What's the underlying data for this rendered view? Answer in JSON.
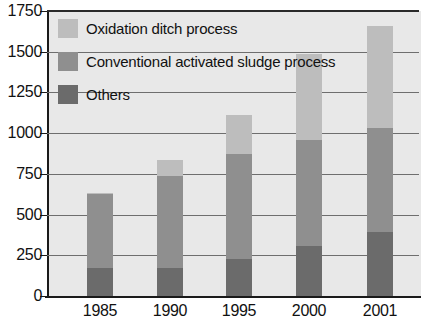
{
  "chart_data": {
    "type": "bar",
    "title": "",
    "subtitle": "",
    "xlabel": "",
    "ylabel": "",
    "stacked": true,
    "grid": true,
    "legend_position": "top-left-inside",
    "categories": [
      "1985",
      "1990",
      "1995",
      "2000",
      "2001"
    ],
    "ylim": [
      0,
      1750
    ],
    "yticks": [
      0,
      250,
      500,
      750,
      1000,
      1250,
      1500,
      1750
    ],
    "ytick_labels": [
      "0",
      "250",
      "500",
      "750",
      "1000",
      "1250",
      "1500",
      "1750"
    ],
    "series": [
      {
        "name": "Others",
        "color": "#6b6b6b",
        "values": [
          170,
          175,
          230,
          305,
          395
        ]
      },
      {
        "name": "Conventional activated sludge process",
        "color": "#8f8f8f",
        "values": [
          455,
          565,
          640,
          655,
          635
        ]
      },
      {
        "name": "Oxidation ditch process",
        "color": "#bdbdbd",
        "values": [
          10,
          95,
          240,
          525,
          630
        ]
      }
    ],
    "totals": [
      635,
      835,
      1110,
      1485,
      1660
    ]
  },
  "legend": {
    "entries": [
      {
        "label": "Oxidation ditch process",
        "color": "#bdbdbd"
      },
      {
        "label": "Conventional activated sludge process",
        "color": "#8f8f8f"
      },
      {
        "label": "Others",
        "color": "#6b6b6b"
      }
    ]
  },
  "colors": {
    "plot_background": "#e8e8e8",
    "axis": "#1a1a1a",
    "gridline": "#6e6e6e",
    "text": "#111111",
    "page_background": "#ffffff"
  }
}
